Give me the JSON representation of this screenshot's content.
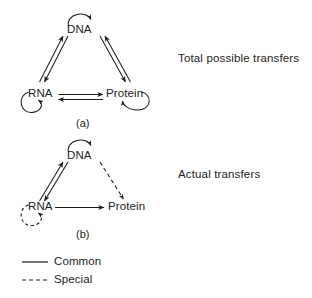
{
  "figure": {
    "title_visible": false,
    "background_color": "#ffffff",
    "stroke_color": "#1c1c1c"
  },
  "panels": [
    {
      "id": "a",
      "caption": "(a)",
      "side_note": "Total possible transfers",
      "nodes": [
        {
          "id": "dna",
          "label": "DNA"
        },
        {
          "id": "rna",
          "label": "RNA"
        },
        {
          "id": "protein",
          "label": "Protein"
        }
      ],
      "self_loops": [
        {
          "node": "dna",
          "style": "solid"
        },
        {
          "node": "rna",
          "style": "solid"
        },
        {
          "node": "protein",
          "style": "solid"
        }
      ],
      "edges": [
        {
          "from": "dna",
          "to": "rna",
          "style": "solid",
          "direction": "both"
        },
        {
          "from": "dna",
          "to": "protein",
          "style": "solid",
          "direction": "both"
        },
        {
          "from": "rna",
          "to": "protein",
          "style": "solid",
          "direction": "both"
        }
      ]
    },
    {
      "id": "b",
      "caption": "(b)",
      "side_note": "Actual transfers",
      "nodes": [
        {
          "id": "dna",
          "label": "DNA"
        },
        {
          "id": "rna",
          "label": "RNA"
        },
        {
          "id": "protein",
          "label": "Protein"
        }
      ],
      "self_loops": [
        {
          "node": "dna",
          "style": "solid"
        },
        {
          "node": "rna",
          "style": "dashed"
        }
      ],
      "edges": [
        {
          "from": "dna",
          "to": "rna",
          "style": "solid",
          "direction": "both"
        },
        {
          "from": "dna",
          "to": "protein",
          "style": "dashed",
          "direction": "forward"
        },
        {
          "from": "rna",
          "to": "protein",
          "style": "solid",
          "direction": "forward"
        }
      ]
    }
  ],
  "legend": {
    "items": [
      {
        "label": "Common",
        "style": "solid"
      },
      {
        "label": "Special",
        "style": "dashed"
      }
    ]
  }
}
